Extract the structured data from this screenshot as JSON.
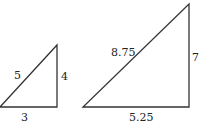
{
  "diagram": {
    "type": "similar-right-triangles",
    "stroke_color": "#333333",
    "triangles": [
      {
        "name": "small",
        "labels": {
          "hypotenuse": "5",
          "vertical": "4",
          "base": "3"
        }
      },
      {
        "name": "large",
        "labels": {
          "hypotenuse": "8.75",
          "vertical": "7",
          "base": "5.25"
        }
      }
    ]
  }
}
